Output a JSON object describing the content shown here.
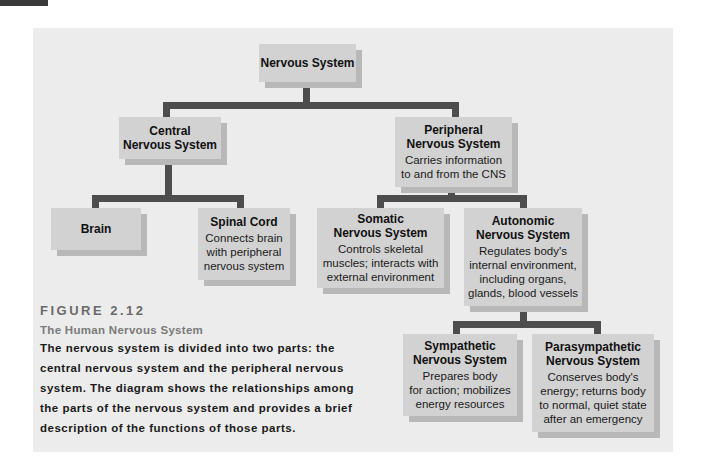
{
  "figure": {
    "number": "FIGURE 2.12",
    "title": "The Human Nervous System",
    "caption_lines": [
      "The nervous system is divided into two parts: the",
      "central nervous system and the peripheral nervous",
      "system. The diagram shows the relationships among",
      "the parts of the nervous system and provides a brief",
      "description of the functions of those parts."
    ]
  },
  "nodes": {
    "root": {
      "title": "Nervous System"
    },
    "cns": {
      "title_lines": [
        "Central",
        "Nervous System"
      ]
    },
    "pns": {
      "title_lines": [
        "Peripheral",
        "Nervous System"
      ],
      "desc_lines": [
        "Carries information",
        "to and from the CNS"
      ]
    },
    "brain": {
      "title": "Brain"
    },
    "spinal": {
      "title": "Spinal Cord",
      "desc_lines": [
        "Connects brain",
        "with peripheral",
        "nervous system"
      ]
    },
    "somatic": {
      "title_lines": [
        "Somatic",
        "Nervous System"
      ],
      "desc_lines": [
        "Controls skeletal",
        "muscles; interacts with",
        "external environment"
      ]
    },
    "autonomic": {
      "title_lines": [
        "Autonomic",
        "Nervous System"
      ],
      "desc_lines": [
        "Regulates body's",
        "internal environment,",
        "including organs,",
        "glands, blood vessels"
      ]
    },
    "sympathetic": {
      "title_lines": [
        "Sympathetic",
        "Nervous System"
      ],
      "desc_lines": [
        "Prepares body",
        "for action; mobilizes",
        "energy resources"
      ]
    },
    "parasympathetic": {
      "title_lines": [
        "Parasympathetic",
        "Nervous System"
      ],
      "desc_lines": [
        "Conserves body's",
        "energy; returns body",
        "to normal, quiet state",
        "after an emergency"
      ]
    }
  },
  "colors": {
    "panel": "#ececec",
    "box": "#d2d2d2",
    "box_shadow": "#b8b8b8",
    "connector": "#4d4d4d"
  }
}
